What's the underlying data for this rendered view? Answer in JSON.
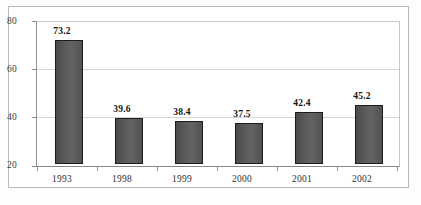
{
  "chart_data": {
    "type": "bar",
    "title": "",
    "subtitle": "",
    "xlabel": "",
    "ylabel": "",
    "categories": [
      "1993",
      "1998",
      "1999",
      "2000",
      "2001",
      "2002"
    ],
    "values": [
      73.2,
      39.6,
      38.4,
      37.5,
      42.4,
      45.2
    ],
    "value_labels": [
      "73.2",
      "39.6",
      "38.4",
      "37.5",
      "42.4",
      "45.2"
    ],
    "ylim": [
      20,
      80
    ],
    "yticks": [
      20,
      40,
      60,
      80
    ],
    "ytick_labels": [
      "20",
      "40",
      "60",
      "80"
    ],
    "grid": true,
    "grid_axis": "y",
    "legend": false,
    "legend_position": "none",
    "series": [
      {
        "name": "",
        "values": [
          73.2,
          39.6,
          38.4,
          37.5,
          42.4,
          45.2
        ]
      }
    ],
    "annotations": []
  },
  "style": {
    "bar_fill": "#5c5c5c",
    "bar_border": "#1c1c1c",
    "gridline_color": "#d4d4d4",
    "axis_color": "#8a8a8a",
    "frame_color": "#b9b9b9",
    "text_color": "#2e2e2e",
    "background": "#ffffff"
  }
}
